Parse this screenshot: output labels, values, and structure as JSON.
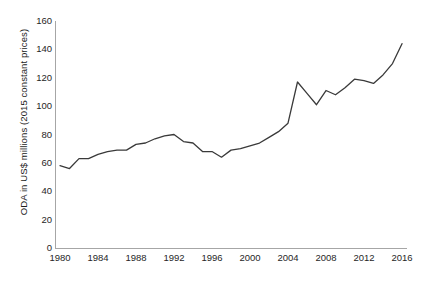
{
  "chart_data": {
    "type": "line",
    "title": "",
    "xlabel": "",
    "ylabel": "ODA in US$ millions (2015 constant prices)",
    "xlim": [
      1980,
      2016
    ],
    "ylim": [
      0,
      160
    ],
    "ytick_step": 20,
    "xtick_step": 4,
    "grid": false,
    "legend": "none",
    "line_color": "#3a3a3a",
    "axis_color": "#a6a6a6",
    "ytick_labels": [
      "160",
      "140",
      "120",
      "100",
      "80",
      "60",
      "40",
      "20",
      "0"
    ],
    "ytick_values": [
      160,
      140,
      120,
      100,
      80,
      60,
      40,
      20,
      0
    ],
    "xtick_labels": [
      "1980",
      "1984",
      "1988",
      "1992",
      "1996",
      "2000",
      "2004",
      "2008",
      "2012",
      "2016"
    ],
    "xtick_values": [
      1980,
      1984,
      1988,
      1992,
      1996,
      2000,
      2004,
      2008,
      2012,
      2016
    ],
    "x": [
      1980,
      1981,
      1982,
      1983,
      1984,
      1985,
      1986,
      1987,
      1988,
      1989,
      1990,
      1991,
      1992,
      1993,
      1994,
      1995,
      1996,
      1997,
      1998,
      1999,
      2000,
      2001,
      2002,
      2003,
      2004,
      2005,
      2006,
      2007,
      2008,
      2009,
      2010,
      2011,
      2012,
      2013,
      2014,
      2015,
      2016
    ],
    "series": [
      {
        "name": "ODA",
        "values": [
          58,
          56,
          63,
          63,
          66,
          68,
          69,
          69,
          73,
          74,
          77,
          79,
          80,
          75,
          74,
          68,
          68,
          64,
          69,
          70,
          72,
          74,
          78,
          82,
          88,
          117,
          109,
          101,
          111,
          108,
          113,
          119,
          118,
          116,
          122,
          130,
          144
        ]
      }
    ]
  }
}
